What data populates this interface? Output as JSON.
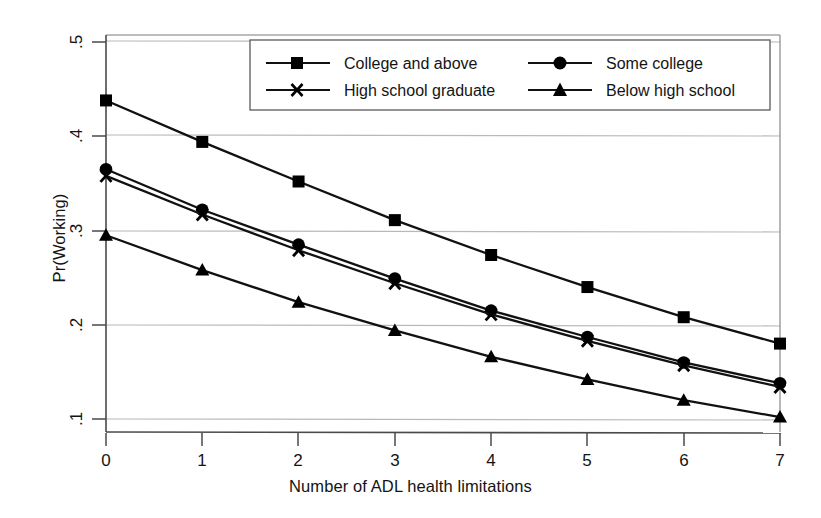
{
  "chart_data": {
    "type": "line",
    "title": "",
    "xlabel": "Number of ADL health limitations",
    "ylabel": "Pr(Working)",
    "x": [
      0,
      1,
      2,
      3,
      4,
      5,
      6,
      7
    ],
    "xtick_labels": [
      "0",
      "1",
      "2",
      "3",
      "4",
      "5",
      "6",
      "7"
    ],
    "ytick_labels": [
      ".1",
      ".2",
      ".3",
      ".4",
      ".5"
    ],
    "yticks": [
      0.1,
      0.2,
      0.3,
      0.4,
      0.5
    ],
    "xlim": [
      0,
      7
    ],
    "ylim": [
      0.092,
      0.515
    ],
    "grid": "horizontal",
    "legend_position": "top-center-inside",
    "series": [
      {
        "name": "College and above",
        "marker": "square",
        "values": [
          0.438,
          0.394,
          0.352,
          0.311,
          0.274,
          0.24,
          0.208,
          0.18
        ]
      },
      {
        "name": "Some college",
        "marker": "circle",
        "values": [
          0.365,
          0.322,
          0.285,
          0.249,
          0.215,
          0.187,
          0.16,
          0.138
        ]
      },
      {
        "name": "High school graduate",
        "marker": "cross",
        "values": [
          0.358,
          0.317,
          0.279,
          0.244,
          0.211,
          0.183,
          0.157,
          0.134
        ]
      },
      {
        "name": "Below high school",
        "marker": "triangle",
        "values": [
          0.295,
          0.258,
          0.224,
          0.194,
          0.166,
          0.142,
          0.12,
          0.102
        ]
      }
    ],
    "colors": {
      "line": "#111111",
      "marker": "#000000",
      "grid": "#b4b4b4",
      "axis": "#555555",
      "background": "#ffffff"
    }
  },
  "legend": {
    "entries": [
      {
        "label": "College and above",
        "marker": "square-marker-icon"
      },
      {
        "label": "Some college",
        "marker": "circle-marker-icon"
      },
      {
        "label": "High school graduate",
        "marker": "cross-marker-icon"
      },
      {
        "label": "Below high school",
        "marker": "triangle-marker-icon"
      }
    ]
  }
}
